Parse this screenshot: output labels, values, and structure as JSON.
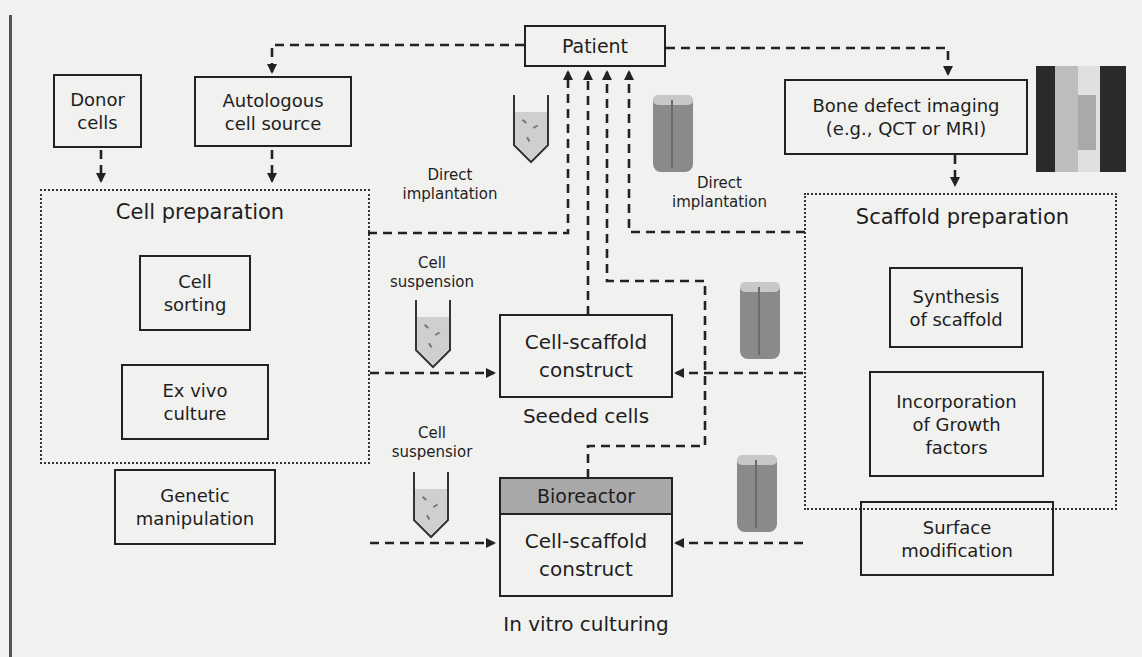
{
  "diagram": {
    "nodes": {
      "patient": "Patient",
      "donor_cells": "Donor\ncells",
      "autologous": "Autologous\ncell source",
      "bone_imaging": "Bone defect imaging\n(e.g., QCT or MRI)",
      "cell_sorting": "Cell\nsorting",
      "ex_vivo": "Ex vivo\nculture",
      "genetic": "Genetic\nmanipulation",
      "seeded_construct": "Cell-scaffold\nconstruct",
      "bioreactor_head": "Bioreactor",
      "bioreactor_construct": "Cell-scaffold\nconstruct",
      "synthesis": "Synthesis\nof scaffold",
      "growth_factors": "Incorporation\nof Growth\nfactors",
      "surface_mod": "Surface\nmodification"
    },
    "groups": {
      "cell_prep": "Cell preparation",
      "scaffold_prep": "Scaffold preparation"
    },
    "labels": {
      "direct_left": "Direct\nimplantation",
      "direct_right": "Direct\nimplantation",
      "cell_susp_1": "Cell\nsuspension",
      "cell_susp_2": "Cell\nsuspensior",
      "seeded_cells": "Seeded cells",
      "in_vitro": "In vitro culturing"
    },
    "icons": [
      "test-tube-cell-suspension-icon",
      "bone-scaffold-icon",
      "bone-ct-image"
    ],
    "colors": {
      "line": "#222222",
      "bioreactor_fill": "#a8a8a8",
      "background": "#f1f1ef"
    }
  }
}
